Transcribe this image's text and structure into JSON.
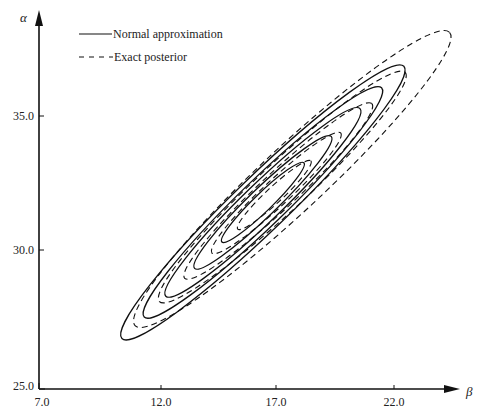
{
  "chart_data": {
    "type": "contour",
    "title": "",
    "xlabel": "β",
    "ylabel": "α",
    "x_ticks": [
      7.0,
      12.0,
      17.0,
      22.0
    ],
    "x_tick_labels": [
      "7.0",
      "12.0",
      "17.0",
      "22.0"
    ],
    "y_ticks": [
      25.0,
      30.0,
      35.0
    ],
    "y_tick_labels": [
      "25.0",
      "30.0",
      "35.0"
    ],
    "xlim": [
      7.0,
      25.0
    ],
    "ylim": [
      25.0,
      38.0
    ],
    "grid": false,
    "legend_position": "upper-left",
    "legend": [
      {
        "label": "Normal approximation",
        "style": "solid"
      },
      {
        "label": "Exact posterior",
        "style": "dashed"
      }
    ],
    "series": [
      {
        "name": "Normal approximation",
        "style": "solid",
        "center": {
          "beta": 16.4,
          "alpha": 31.8
        },
        "angle_deg": -44,
        "levels": [
          {
            "rx": 57,
            "ry": 9
          },
          {
            "rx": 95,
            "ry": 14
          },
          {
            "rx": 135,
            "ry": 19
          },
          {
            "rx": 165,
            "ry": 23
          },
          {
            "rx": 196,
            "ry": 27
          }
        ]
      },
      {
        "name": "Exact posterior",
        "style": "dashed",
        "center": {
          "beta": 16.8,
          "alpha": 32.0
        },
        "angle_deg": -43,
        "levels": [
          {
            "rx": 50,
            "ry": 8,
            "dx": 2,
            "dy": -2
          },
          {
            "rx": 88,
            "ry": 13,
            "dx": 4,
            "dy": -4
          },
          {
            "rx": 128,
            "ry": 18,
            "dx": 6,
            "dy": -6
          },
          {
            "rx": 168,
            "ry": 24,
            "dx": 10,
            "dy": -10
          },
          {
            "rx": 215,
            "ry": 32,
            "dx": 20,
            "dy": -18
          }
        ]
      }
    ],
    "caption": "Figure (partially visible caption, illegible)"
  },
  "axes": {
    "x_symbol": "β",
    "y_symbol": "α",
    "x_ticks": [
      {
        "label": "7.0",
        "px": 42
      },
      {
        "label": "12.0",
        "px": 161
      },
      {
        "label": "17.0",
        "px": 276
      },
      {
        "label": "22.0",
        "px": 394
      }
    ],
    "y_ticks": [
      {
        "label": "25.0",
        "py": 386
      },
      {
        "label": "30.0",
        "py": 250
      },
      {
        "label": "35.0",
        "py": 116
      }
    ]
  },
  "legend": {
    "normal_label": "Normal approximation",
    "exact_label": "Exact posterior"
  }
}
